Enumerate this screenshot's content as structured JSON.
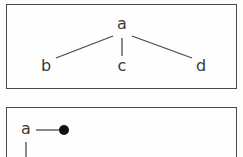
{
  "figure": {
    "background_color": "#fdfdfc",
    "border_color": "#4a4a4a",
    "ink_color": "#3a3a3a",
    "dot_color": "#111111",
    "panels": [
      {
        "panel_id": "top-panel",
        "description": "tree diagram with root a and three children b, c, d",
        "nodes": [
          {
            "id": "a",
            "label": "a",
            "x": 122,
            "y": 25
          },
          {
            "id": "b",
            "label": "b",
            "x": 46,
            "y": 67
          },
          {
            "id": "c",
            "label": "c",
            "x": 122,
            "y": 67
          },
          {
            "id": "d",
            "label": "d",
            "x": 201,
            "y": 67
          }
        ],
        "edges": [
          {
            "from": "a",
            "to": "b",
            "x1": 113,
            "y1": 36,
            "x2": 56,
            "y2": 58
          },
          {
            "from": "a",
            "to": "c",
            "x1": 122,
            "y1": 38,
            "x2": 122,
            "y2": 56
          },
          {
            "from": "a",
            "to": "d",
            "x1": 132,
            "y1": 36,
            "x2": 192,
            "y2": 58
          }
        ]
      },
      {
        "panel_id": "bottom-panel",
        "description": "partially visible diagram: node a joined to a filled dot with a downward edge",
        "nodes": [
          {
            "id": "a2",
            "label": "a",
            "x": 26,
            "y": 130
          }
        ],
        "dots": [
          {
            "id": "filled-node",
            "cx": 64,
            "cy": 130,
            "r": 5
          }
        ],
        "edges": [
          {
            "from": "a2",
            "to": "filled-node",
            "x1": 36,
            "y1": 130,
            "x2": 60,
            "y2": 130
          },
          {
            "from": "a2",
            "to": "below",
            "x1": 26,
            "y1": 142,
            "x2": 26,
            "y2": 159
          }
        ]
      }
    ]
  }
}
